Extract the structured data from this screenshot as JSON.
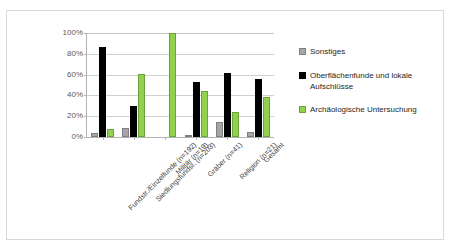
{
  "chart_data": {
    "type": "bar",
    "title": "",
    "subtitle": "",
    "xlabel": "",
    "ylabel": "",
    "ylim": [
      0,
      100
    ],
    "ytick_labels": [
      "100%",
      "80%",
      "60%",
      "40%",
      "20%",
      "0%"
    ],
    "ytick_values": [
      100,
      80,
      60,
      40,
      20,
      0
    ],
    "grid": true,
    "legend_position": "right",
    "categories": [
      "Fundstr./Einzelfunde (n=192)",
      "Siedlungsfundst. (n=203)",
      "Militär (n=19)",
      "Gräber (n=41)",
      "Religion (n=21)",
      "Gesamt"
    ],
    "series": [
      {
        "name": "Sonstiges",
        "color": "#a6a6a6",
        "values": [
          4,
          9,
          0,
          2,
          14,
          5
        ]
      },
      {
        "name": "Oberflächenfunde und lokale Aufschlüsse",
        "color": "#000000",
        "values": [
          87,
          30,
          0,
          53,
          62,
          56
        ]
      },
      {
        "name": "Archäologische Untersuchung",
        "color": "#92d050",
        "values": [
          8,
          61,
          100,
          44,
          24,
          38
        ]
      }
    ]
  },
  "legend": {
    "items": [
      {
        "label": "Sonstiges",
        "swatch": "gray-swatch-icon"
      },
      {
        "label": "Oberflächenfunde und lokale Aufschlüsse",
        "swatch": "black-swatch-icon"
      },
      {
        "label": "Archäologische Untersuchung",
        "swatch": "green-swatch-icon"
      }
    ]
  }
}
